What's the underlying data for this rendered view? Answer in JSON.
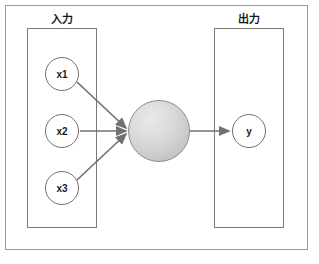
{
  "diagram": {
    "title_input": "入力",
    "title_output": "出力",
    "input_nodes": [
      {
        "label": "x1"
      },
      {
        "label": "x2"
      },
      {
        "label": "x3"
      }
    ],
    "hidden_node": {
      "label": ""
    },
    "output_nodes": [
      {
        "label": "y"
      }
    ],
    "colors": {
      "outer_frame": "#999999",
      "panel_border": "#7a7a7a",
      "node_border": "#6f6f6f",
      "edge": "#707070",
      "neuron_fill_light": "#e8e8e8",
      "neuron_fill_dark": "#b4b4b4",
      "text": "#1a1a1a",
      "background": "#ffffff"
    },
    "edges": [
      {
        "from": "x1",
        "to": "hidden"
      },
      {
        "from": "x2",
        "to": "hidden"
      },
      {
        "from": "x3",
        "to": "hidden"
      },
      {
        "from": "hidden",
        "to": "y"
      }
    ]
  }
}
